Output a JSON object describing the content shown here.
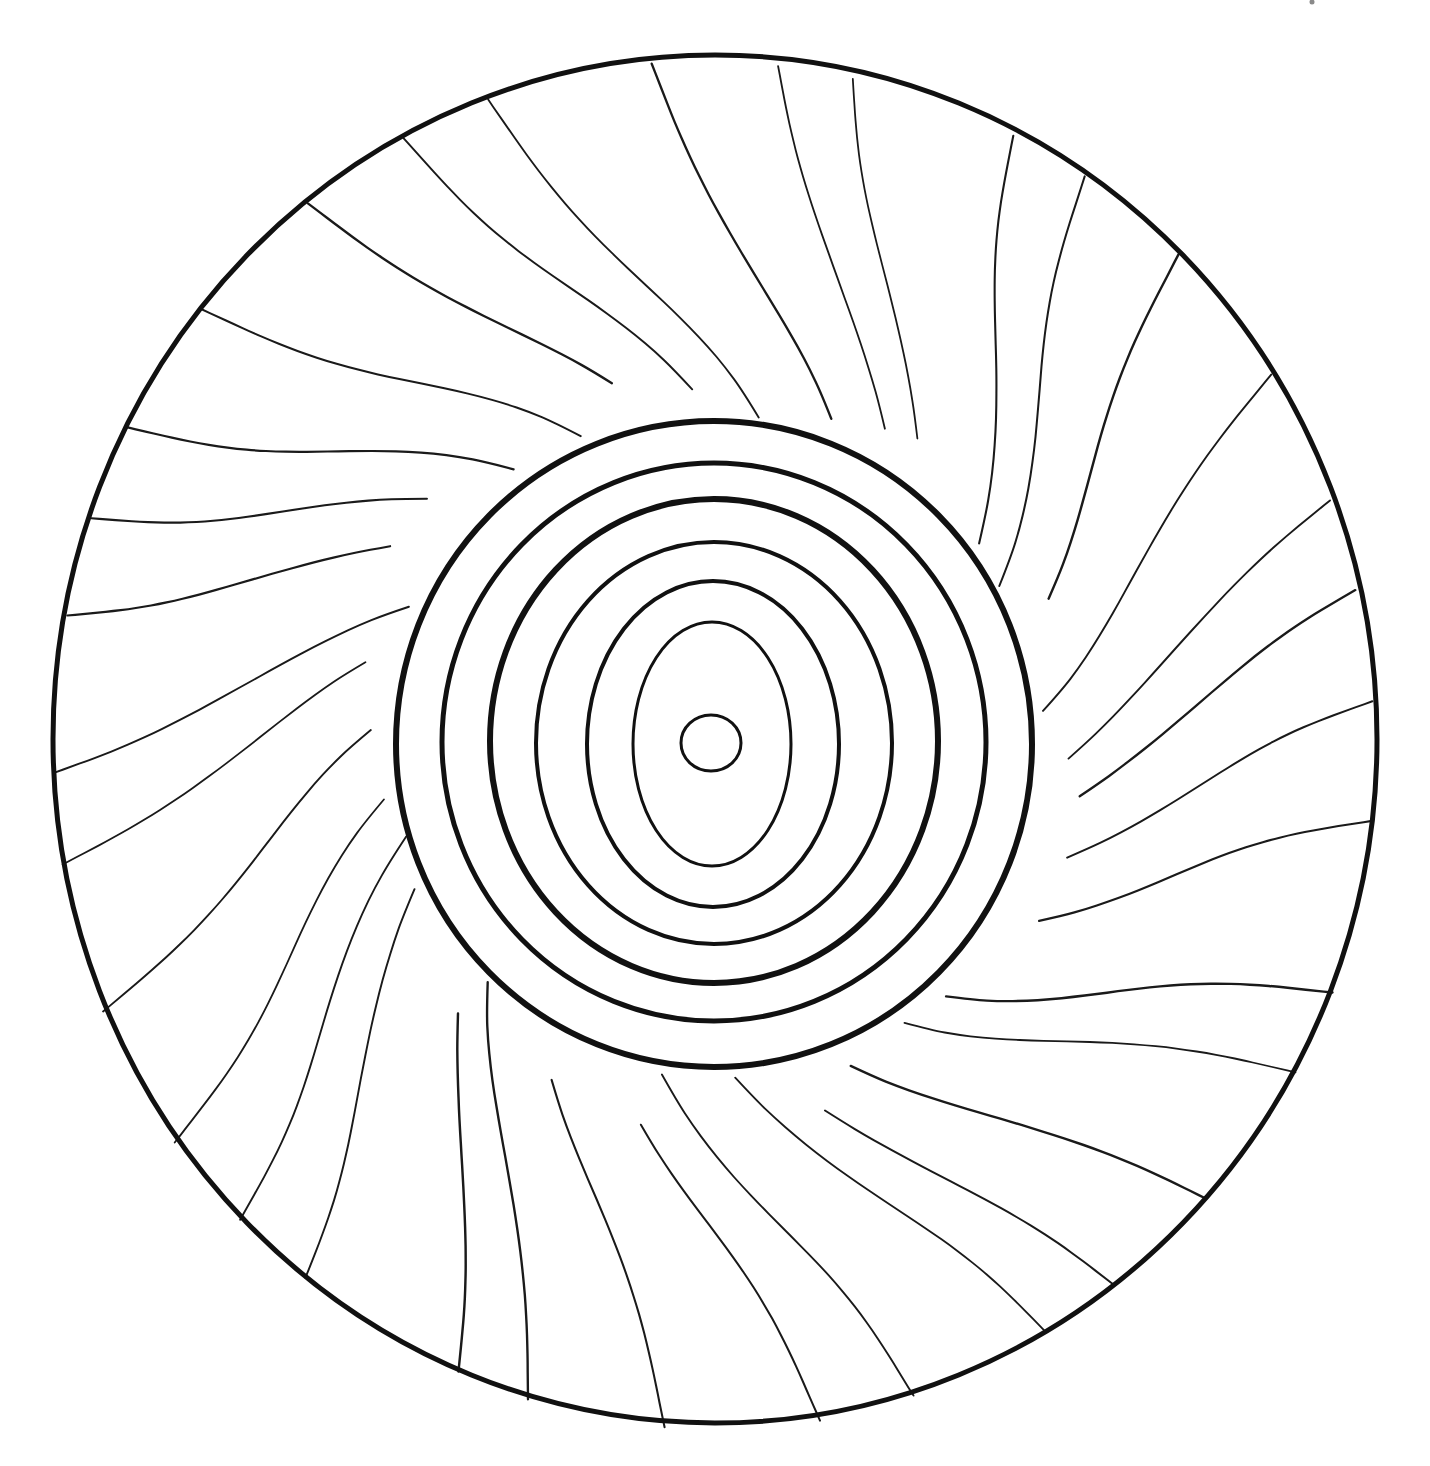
{
  "artwork": {
    "title": "Concentric Circle Spiral Radial Line Drawing",
    "description": "Ink line drawing of a large circle containing seven concentric circles offset toward the center, surrounded by an annulus of thin curved spiral rays radiating counter-clockwise to the outer rim.",
    "medium": "pen-and-ink line drawing",
    "background_color": "#ffffff",
    "stroke_color": "#111111",
    "ray_stroke_color": "#1a1a1a",
    "canvas": {
      "width": 1430,
      "height": 1466
    }
  },
  "chart_data": {
    "type": "scatter",
    "xlabel": "",
    "ylabel": "",
    "xlim": [
      0,
      1430
    ],
    "ylim": [
      0,
      1466
    ],
    "grid": false,
    "legend": null,
    "outer_boundary": {
      "name": "outer-rim",
      "shape": "ellipse",
      "cx": 715,
      "cy": 739,
      "rx": 662,
      "ry": 684,
      "stroke_width": 5
    },
    "concentric_rings": [
      {
        "index": 1,
        "name": "ring-outermost",
        "cx": 714,
        "cy": 744,
        "rx": 318,
        "ry": 323,
        "stroke_width": 6
      },
      {
        "index": 2,
        "name": "ring-2",
        "cx": 714,
        "cy": 742,
        "rx": 272,
        "ry": 279,
        "stroke_width": 5
      },
      {
        "index": 3,
        "name": "ring-3",
        "cx": 714,
        "cy": 741,
        "rx": 224,
        "ry": 242,
        "stroke_width": 6
      },
      {
        "index": 4,
        "name": "ring-4",
        "cx": 714,
        "cy": 743,
        "rx": 178,
        "ry": 201,
        "stroke_width": 4
      },
      {
        "index": 5,
        "name": "ring-5",
        "cx": 713,
        "cy": 744,
        "rx": 126,
        "ry": 163,
        "stroke_width": 4
      },
      {
        "index": 6,
        "name": "ring-6",
        "cx": 712,
        "cy": 744,
        "rx": 79,
        "ry": 122,
        "stroke_width": 3
      },
      {
        "index": 7,
        "name": "ring-innermost",
        "cx": 711,
        "cy": 743,
        "rx": 30,
        "ry": 28,
        "stroke_width": 3
      }
    ],
    "ray_band": {
      "name": "spiral-ray-annulus",
      "inner_radius_ref": 323,
      "outer_radius_ref": 670,
      "count": 34,
      "stroke_width": 2.1,
      "spiral_direction": "counter-clockwise-outward",
      "sweep_degrees": 34,
      "note": "Thin S-curved rays spanning from the outermost concentric ring to the outer rim; spacing varies, densest in the upper-left and lower-right quadrants."
    },
    "marks": [
      {
        "name": "ink-speck",
        "x": 1312,
        "y": 2,
        "r": 2.5,
        "color": "#8a8a8a"
      }
    ],
    "series": [
      {
        "name": "concentric_ring_radii_px",
        "x": [
          1,
          2,
          3,
          4,
          5,
          6,
          7
        ],
        "values": [
          323,
          279,
          242,
          201,
          163,
          122,
          28
        ]
      },
      {
        "name": "ring_stroke_widths_px",
        "x": [
          1,
          2,
          3,
          4,
          5,
          6,
          7
        ],
        "values": [
          6,
          5,
          6,
          4,
          4,
          3,
          3
        ]
      }
    ]
  }
}
